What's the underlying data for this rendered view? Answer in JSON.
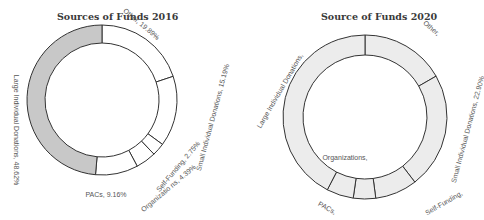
{
  "chart_data": [
    {
      "type": "pie",
      "subtype": "donut",
      "title": "Sources of Funds 2016",
      "categories": [
        "Other",
        "Small Individual Donations",
        "Self-Funding",
        "Organizations",
        "PACs",
        "Large Individual Donations"
      ],
      "values": [
        19.89,
        15.19,
        2.75,
        4.39,
        9.16,
        48.62
      ],
      "labels": [
        "Other, 19.89%",
        "Small Individual Donations, 15.19%",
        "Self-Funding, 2.75%",
        "Organizatio ns, 4.39%",
        "PACs, 9.16%",
        "Large Individual Donations, 48.62%"
      ],
      "highlighted": "Large Individual Donations",
      "colors": {
        "highlight": "#c8c8c8",
        "default": "#ffffff",
        "stroke": "#333333"
      }
    },
    {
      "type": "pie",
      "subtype": "donut",
      "title": "Source of Funds 2020",
      "categories": [
        "Other",
        "Small Individual Donations",
        "Self-Funding",
        "Organizations",
        "PACs",
        "Large Individual Donations"
      ],
      "values": [
        16.7,
        22.9,
        8.3,
        4.4,
        5.3,
        42.4
      ],
      "labels": [
        "Other,",
        "Small Individual Donations, 22.90%",
        "Self-Funding,",
        "Organizations,",
        "PACs,",
        "Large Individual Donations,"
      ],
      "colors": {
        "fill": "#ececec",
        "stroke": "#333333"
      }
    }
  ]
}
